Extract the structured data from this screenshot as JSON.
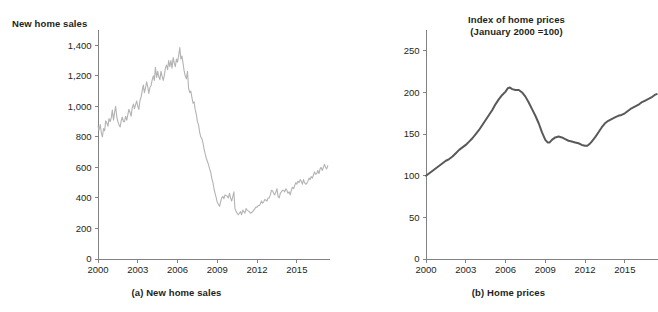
{
  "figure": {
    "background": "#ffffff",
    "text_color": "#231f20"
  },
  "chart_data": [
    {
      "id": "new-home-sales",
      "type": "line",
      "title": "New home sales",
      "caption": "(a) New home sales",
      "xlabel": "",
      "ylabel": "New home sales",
      "line_color": "#b3b3b3",
      "line_width": 1.1,
      "grid": false,
      "legend": "none",
      "xlim": [
        2000,
        2017.5
      ],
      "ylim": [
        0,
        1500
      ],
      "xticks": [
        2000,
        2003,
        2006,
        2009,
        2012,
        2015
      ],
      "xtick_labels": [
        "2000",
        "2003",
        "2006",
        "2009",
        "2012",
        "2015"
      ],
      "yticks": [
        0,
        200,
        400,
        600,
        800,
        1000,
        1200,
        1400
      ],
      "ytick_labels": [
        "0",
        "200",
        "400",
        "600",
        "800",
        "1,000",
        "1,200",
        "1,400"
      ],
      "x": [
        2000.0,
        2000.08,
        2000.17,
        2000.25,
        2000.33,
        2000.42,
        2000.5,
        2000.58,
        2000.67,
        2000.75,
        2000.83,
        2000.92,
        2001.0,
        2001.08,
        2001.17,
        2001.25,
        2001.33,
        2001.42,
        2001.5,
        2001.58,
        2001.67,
        2001.75,
        2001.83,
        2001.92,
        2002.0,
        2002.08,
        2002.17,
        2002.25,
        2002.33,
        2002.42,
        2002.5,
        2002.58,
        2002.67,
        2002.75,
        2002.83,
        2002.92,
        2003.0,
        2003.08,
        2003.17,
        2003.25,
        2003.33,
        2003.42,
        2003.5,
        2003.58,
        2003.67,
        2003.75,
        2003.83,
        2003.92,
        2004.0,
        2004.08,
        2004.17,
        2004.25,
        2004.33,
        2004.42,
        2004.5,
        2004.58,
        2004.67,
        2004.75,
        2004.83,
        2004.92,
        2005.0,
        2005.08,
        2005.17,
        2005.25,
        2005.33,
        2005.42,
        2005.5,
        2005.58,
        2005.67,
        2005.75,
        2005.83,
        2005.92,
        2006.0,
        2006.08,
        2006.17,
        2006.25,
        2006.33,
        2006.42,
        2006.5,
        2006.58,
        2006.67,
        2006.75,
        2006.83,
        2006.92,
        2007.0,
        2007.08,
        2007.17,
        2007.25,
        2007.33,
        2007.42,
        2007.5,
        2007.58,
        2007.67,
        2007.75,
        2007.83,
        2007.92,
        2008.0,
        2008.08,
        2008.17,
        2008.25,
        2008.33,
        2008.42,
        2008.5,
        2008.58,
        2008.67,
        2008.75,
        2008.83,
        2008.92,
        2009.0,
        2009.08,
        2009.17,
        2009.25,
        2009.33,
        2009.42,
        2009.5,
        2009.58,
        2009.67,
        2009.75,
        2009.83,
        2009.92,
        2010.0,
        2010.08,
        2010.17,
        2010.25,
        2010.33,
        2010.42,
        2010.5,
        2010.58,
        2010.67,
        2010.75,
        2010.83,
        2010.92,
        2011.0,
        2011.08,
        2011.17,
        2011.25,
        2011.33,
        2011.42,
        2011.5,
        2011.58,
        2011.67,
        2011.75,
        2011.83,
        2011.92,
        2012.0,
        2012.08,
        2012.17,
        2012.25,
        2012.33,
        2012.42,
        2012.5,
        2012.58,
        2012.67,
        2012.75,
        2012.83,
        2012.92,
        2013.0,
        2013.08,
        2013.17,
        2013.25,
        2013.33,
        2013.42,
        2013.5,
        2013.58,
        2013.67,
        2013.75,
        2013.83,
        2013.92,
        2014.0,
        2014.08,
        2014.17,
        2014.25,
        2014.33,
        2014.42,
        2014.5,
        2014.58,
        2014.67,
        2014.75,
        2014.83,
        2014.92,
        2015.0,
        2015.08,
        2015.17,
        2015.25,
        2015.33,
        2015.42,
        2015.5,
        2015.58,
        2015.67,
        2015.75,
        2015.83,
        2015.92,
        2016.0,
        2016.08,
        2016.17,
        2016.25,
        2016.33,
        2016.42,
        2016.5,
        2016.58,
        2016.67,
        2016.75,
        2016.83,
        2016.92,
        2017.0,
        2017.08,
        2017.17,
        2017.25,
        2017.33
      ],
      "y": [
        870,
        845,
        880,
        828,
        800,
        855,
        840,
        905,
        890,
        870,
        920,
        900,
        925,
        975,
        910,
        960,
        1000,
        930,
        900,
        880,
        865,
        905,
        930,
        900,
        900,
        935,
        910,
        945,
        980,
        960,
        935,
        990,
        1015,
        985,
        1010,
        1035,
        1000,
        980,
        1040,
        1060,
        1100,
        1140,
        1090,
        1120,
        1160,
        1130,
        1085,
        1125,
        1135,
        1170,
        1200,
        1170,
        1255,
        1190,
        1230,
        1195,
        1175,
        1230,
        1200,
        1170,
        1200,
        1250,
        1270,
        1240,
        1300,
        1260,
        1300,
        1250,
        1320,
        1285,
        1260,
        1310,
        1290,
        1330,
        1385,
        1310,
        1330,
        1280,
        1230,
        1200,
        1180,
        1230,
        1120,
        1090,
        1100,
        1060,
        1020,
        1030,
        980,
        945,
        900,
        880,
        830,
        800,
        790,
        760,
        720,
        690,
        660,
        640,
        620,
        590,
        570,
        530,
        500,
        460,
        430,
        400,
        370,
        360,
        345,
        375,
        400,
        410,
        395,
        420,
        415,
        410,
        400,
        430,
        400,
        380,
        410,
        440,
        330,
        310,
        300,
        290,
        300,
        310,
        290,
        320,
        310,
        300,
        330,
        320,
        315,
        310,
        300,
        305,
        310,
        320,
        330,
        340,
        340,
        350,
        350,
        360,
        380,
        365,
        375,
        390,
        385,
        380,
        400,
        400,
        420,
        450,
        445,
        430,
        420,
        440,
        460,
        410,
        400,
        430,
        440,
        450,
        450,
        440,
        460,
        450,
        430,
        440,
        420,
        450,
        470,
        460,
        480,
        500,
        490,
        510,
        500,
        520,
        510,
        490,
        520,
        500,
        490,
        495,
        510,
        530,
        520,
        540,
        530,
        550,
        570,
        555,
        560,
        580,
        560,
        590,
        600,
        580,
        600,
        620,
        600,
        590,
        610
      ]
    },
    {
      "id": "home-prices",
      "type": "line",
      "title_line1": "Index of home prices",
      "title_line2": "(January 2000 =100)",
      "caption": "(b) Home prices",
      "xlabel": "",
      "ylabel": "Index of home prices (January 2000 =100)",
      "line_color": "#595959",
      "line_width": 2.0,
      "grid": false,
      "legend": "none",
      "xlim": [
        2000,
        2017.5
      ],
      "ylim": [
        0,
        275
      ],
      "xticks": [
        2000,
        2003,
        2006,
        2009,
        2012,
        2015
      ],
      "xtick_labels": [
        "2000",
        "2003",
        "2006",
        "2009",
        "2012",
        "2015"
      ],
      "yticks": [
        0,
        50,
        100,
        150,
        200,
        250
      ],
      "ytick_labels": [
        "0",
        "50",
        "100",
        "150",
        "200",
        "250"
      ],
      "x": [
        2000.0,
        2000.25,
        2000.5,
        2000.75,
        2001.0,
        2001.25,
        2001.5,
        2001.75,
        2002.0,
        2002.25,
        2002.5,
        2002.75,
        2003.0,
        2003.25,
        2003.5,
        2003.75,
        2004.0,
        2004.25,
        2004.5,
        2004.75,
        2005.0,
        2005.25,
        2005.5,
        2005.75,
        2006.0,
        2006.17,
        2006.33,
        2006.5,
        2006.75,
        2007.0,
        2007.25,
        2007.5,
        2007.75,
        2008.0,
        2008.25,
        2008.5,
        2008.75,
        2009.0,
        2009.17,
        2009.33,
        2009.5,
        2009.75,
        2010.0,
        2010.25,
        2010.5,
        2010.75,
        2011.0,
        2011.25,
        2011.5,
        2011.75,
        2012.0,
        2012.17,
        2012.33,
        2012.5,
        2012.75,
        2013.0,
        2013.25,
        2013.5,
        2013.75,
        2014.0,
        2014.25,
        2014.5,
        2014.75,
        2015.0,
        2015.25,
        2015.5,
        2015.75,
        2016.0,
        2016.25,
        2016.5,
        2016.75,
        2017.0,
        2017.25,
        2017.4
      ],
      "y": [
        100,
        103,
        106,
        109,
        112,
        115,
        118,
        120,
        123,
        127,
        131,
        134,
        137,
        141,
        145,
        150,
        155,
        161,
        167,
        173,
        179,
        186,
        192,
        197,
        201,
        205,
        206,
        204,
        203,
        203,
        200,
        195,
        188,
        180,
        172,
        163,
        152,
        143,
        140,
        140,
        143,
        146,
        147,
        146,
        144,
        142,
        141,
        140,
        139,
        137,
        136,
        136,
        138,
        141,
        146,
        152,
        158,
        163,
        166,
        168,
        170,
        172,
        173,
        175,
        178,
        181,
        183,
        185,
        188,
        190,
        192,
        194,
        197,
        198
      ]
    }
  ]
}
